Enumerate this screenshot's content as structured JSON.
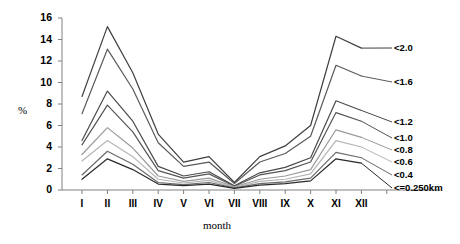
{
  "chart_data": {
    "type": "line",
    "title": "",
    "xlabel": "month",
    "ylabel": "%",
    "ylim": [
      0,
      16
    ],
    "yticks": [
      0,
      2,
      4,
      6,
      8,
      10,
      12,
      14,
      16
    ],
    "grid": false,
    "legend_position": "right-inline",
    "categories": [
      "I",
      "II",
      "III",
      "IV",
      "V",
      "VI",
      "VII",
      "VIII",
      "IX",
      "X",
      "XI",
      "XII"
    ],
    "series": [
      {
        "name": "<2.0",
        "color": "#3f3f3f",
        "values": [
          8.7,
          15.2,
          10.9,
          5.2,
          2.6,
          3.1,
          0.7,
          3.1,
          4.1,
          6.0,
          14.3,
          13.2
        ]
      },
      {
        "name": "<1.6",
        "color": "#5a5a5a",
        "values": [
          7.1,
          13.1,
          9.4,
          4.4,
          2.2,
          2.6,
          0.6,
          2.6,
          3.4,
          5.0,
          11.6,
          10.6
        ]
      },
      {
        "name": "<1.2",
        "color": "#4a4a4a",
        "values": [
          4.6,
          9.2,
          6.4,
          2.2,
          1.3,
          1.7,
          0.4,
          1.6,
          2.1,
          3.0,
          8.3,
          7.4
        ]
      },
      {
        "name": "<1.0",
        "color": "#555555",
        "values": [
          4.2,
          7.9,
          5.4,
          1.8,
          1.1,
          1.5,
          0.35,
          1.4,
          1.8,
          2.6,
          7.2,
          6.4
        ]
      },
      {
        "name": "<0.8",
        "color": "#9a9a9a",
        "values": [
          3.3,
          5.8,
          3.9,
          1.3,
          0.8,
          1.1,
          0.3,
          1.0,
          1.3,
          1.9,
          5.6,
          4.9
        ]
      },
      {
        "name": "<0.6",
        "color": "#b5b5b5",
        "values": [
          2.7,
          4.6,
          3.1,
          1.0,
          0.65,
          0.9,
          0.25,
          0.8,
          1.0,
          1.5,
          4.6,
          4.0
        ]
      },
      {
        "name": "<0.4",
        "color": "#6b6b6b",
        "values": [
          1.4,
          3.6,
          2.4,
          0.7,
          0.5,
          0.7,
          0.2,
          0.6,
          0.75,
          1.1,
          3.5,
          3.0
        ]
      },
      {
        "name": "<=0.250km",
        "color": "#2a2a2a",
        "values": [
          1.0,
          2.9,
          1.9,
          0.55,
          0.4,
          0.55,
          0.15,
          0.45,
          0.6,
          0.85,
          2.9,
          2.5
        ]
      }
    ],
    "legend_entries": [
      {
        "label": "<2.0"
      },
      {
        "label": "<1.6"
      },
      {
        "label": "<1.2"
      },
      {
        "label": "<1.0"
      },
      {
        "label": "<0.8"
      },
      {
        "label": "<0.6"
      },
      {
        "label": "<0.4"
      },
      {
        "label": "<=0.250km"
      }
    ],
    "leader_anchor_values": [
      14.3,
      11.6,
      8.3,
      7.2,
      5.6,
      4.6,
      3.5,
      2.9
    ],
    "legend_y_positions": [
      44,
      78,
      118,
      134,
      146,
      158,
      171,
      184
    ],
    "axis_color": "#808080",
    "text_color": "#000000"
  }
}
